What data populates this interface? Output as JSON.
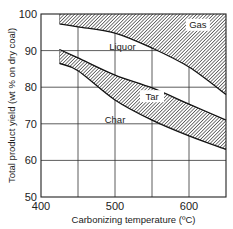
{
  "chart_data": {
    "type": "area",
    "title": "",
    "xlabel": "Carbonizing temperature (ºC)",
    "ylabel": "Total product yield (wt % on dry coal)",
    "xlim": [
      400,
      650
    ],
    "ylim": [
      50,
      100
    ],
    "xticks": [
      400,
      500,
      600
    ],
    "yticks": [
      50,
      60,
      70,
      80,
      90,
      100
    ],
    "grid": true,
    "x": [
      425,
      450,
      500,
      550,
      600,
      650
    ],
    "boundaries": [
      {
        "name": "Char/Tar boundary",
        "values": [
          86.5,
          84.5,
          76.5,
          71,
          66.7,
          63
        ]
      },
      {
        "name": "Tar/Liquor boundary",
        "values": [
          90.3,
          88.0,
          83.3,
          79.8,
          75.4,
          71
        ]
      },
      {
        "name": "Liquor/Gas boundary",
        "values": [
          97.3,
          96.5,
          94.8,
          90.7,
          85.5,
          78
        ]
      }
    ],
    "regions": [
      {
        "name": "Char",
        "label": "Char",
        "hatched": false,
        "label_at": [
          500,
          70.5
        ]
      },
      {
        "name": "Tar",
        "label": "Tar",
        "hatched": true,
        "label_at": [
          550,
          77
        ]
      },
      {
        "name": "Liquor",
        "label": "Liquor",
        "hatched": false,
        "label_at": [
          510,
          90.5
        ]
      },
      {
        "name": "Gas",
        "label": "Gas",
        "hatched": true,
        "label_at": [
          612,
          96.5
        ]
      }
    ],
    "legend": "none"
  }
}
